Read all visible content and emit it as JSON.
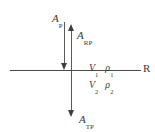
{
  "figure": {
    "type": "seismic-reflection-transmission-diagram",
    "axis": {
      "label": "R"
    },
    "rays": [
      {
        "id": "incident",
        "symbol": "A",
        "subscript": "P",
        "direction": "down",
        "description": "incident P-wave amplitude"
      },
      {
        "id": "reflected",
        "symbol": "A",
        "subscript": "RP",
        "direction": "up",
        "description": "reflected P-wave amplitude"
      },
      {
        "id": "transmitted",
        "symbol": "A",
        "subscript": "TP",
        "direction": "down",
        "description": "transmitted P-wave amplitude"
      }
    ],
    "media": [
      {
        "id": "upper",
        "velocity_symbol": "V",
        "velocity_sub": "1",
        "density_symbol": "ρ",
        "density_sub": "1"
      },
      {
        "id": "lower",
        "velocity_symbol": "V",
        "velocity_sub": "2",
        "density_symbol": "ρ",
        "density_sub": "2"
      }
    ],
    "colors": {
      "stroke": "#555555",
      "arrowhead": "#3d3d3d",
      "text": "#3a3a3a",
      "background": "#ffffff"
    }
  }
}
